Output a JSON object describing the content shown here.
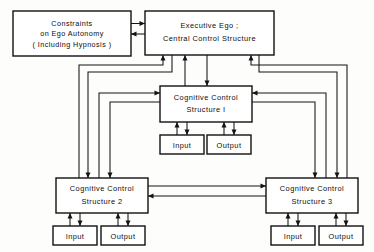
{
  "diagram": {
    "background_color": "#fdfdfb",
    "line_color": "#141414",
    "box_fill": "#ffffff",
    "box_stroke": "#111111",
    "boxes": {
      "constraints": {
        "name": "constraints-box",
        "lines": [
          "Constraints",
          "on Ego Autonomy",
          "( Including  Hypnosis )"
        ]
      },
      "executive": {
        "name": "executive-ego-box",
        "lines": [
          "Executive  Ego ;",
          "Central  Control  Structure"
        ]
      },
      "ccs1": {
        "name": "cognitive-control-structure-1-box",
        "lines": [
          "Cognitive  Control",
          "Structure I"
        ]
      },
      "ccs2": {
        "name": "cognitive-control-structure-2-box",
        "lines": [
          "Cognitive  Control",
          "Structure 2"
        ]
      },
      "ccs3": {
        "name": "cognitive-control-structure-3-box",
        "lines": [
          "Cognitive  Control",
          "Structure 3"
        ]
      },
      "io": {
        "input_label": "Input",
        "output_label": "Output"
      }
    },
    "io_groups": [
      {
        "owner": "ccs1",
        "input": "Input",
        "output": "Output"
      },
      {
        "owner": "ccs2",
        "input": "Input",
        "output": "Output"
      },
      {
        "owner": "ccs3",
        "input": "Input",
        "output": "Output"
      }
    ],
    "connections": [
      {
        "from": "constraints",
        "to": "executive",
        "direction": "right"
      },
      {
        "from": "executive",
        "to": "constraints",
        "direction": "left"
      },
      {
        "from": "ccs1",
        "to": "executive",
        "direction": "up"
      },
      {
        "from": "executive",
        "to": "ccs1",
        "direction": "down"
      },
      {
        "from": "ccs2",
        "to": "executive",
        "direction": "up"
      },
      {
        "from": "executive",
        "to": "ccs2",
        "direction": "down"
      },
      {
        "from": "ccs3",
        "to": "executive",
        "direction": "up"
      },
      {
        "from": "executive",
        "to": "ccs3",
        "direction": "down"
      },
      {
        "from": "ccs2",
        "to": "ccs1",
        "direction": "right"
      },
      {
        "from": "ccs1",
        "to": "ccs2",
        "direction": "down"
      },
      {
        "from": "ccs3",
        "to": "ccs1",
        "direction": "left"
      },
      {
        "from": "ccs1",
        "to": "ccs3",
        "direction": "down"
      },
      {
        "from": "ccs2",
        "to": "ccs3",
        "direction": "right"
      },
      {
        "from": "ccs3",
        "to": "ccs2",
        "direction": "left"
      },
      {
        "from": "ccs1",
        "to": "input1",
        "direction": "down"
      },
      {
        "from": "input1",
        "to": "ccs1",
        "direction": "up"
      },
      {
        "from": "ccs1",
        "to": "output1",
        "direction": "down"
      },
      {
        "from": "output1",
        "to": "ccs1",
        "direction": "up"
      },
      {
        "from": "ccs2",
        "to": "input2",
        "direction": "down"
      },
      {
        "from": "input2",
        "to": "ccs2",
        "direction": "up"
      },
      {
        "from": "ccs2",
        "to": "output2",
        "direction": "down"
      },
      {
        "from": "output2",
        "to": "ccs2",
        "direction": "up"
      },
      {
        "from": "ccs3",
        "to": "input3",
        "direction": "down"
      },
      {
        "from": "input3",
        "to": "ccs3",
        "direction": "up"
      },
      {
        "from": "ccs3",
        "to": "output3",
        "direction": "down"
      },
      {
        "from": "output3",
        "to": "ccs3",
        "direction": "up"
      }
    ]
  }
}
